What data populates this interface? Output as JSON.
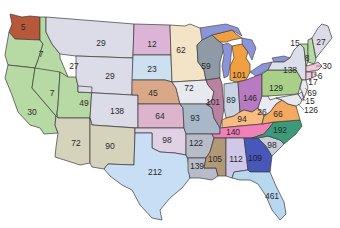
{
  "map": {
    "title": "",
    "states": [
      {
        "abbr": "WA",
        "value": "5",
        "color": "#b8583a",
        "x": 23,
        "y": 27
      },
      {
        "abbr": "OR",
        "value": "7",
        "color": "#b7d9a3",
        "x": 41,
        "y": 54
      },
      {
        "abbr": "ID",
        "value": "27",
        "color": "#b7d9a3",
        "x": 74,
        "y": 66
      },
      {
        "abbr": "CA",
        "value": "30",
        "color": "#b7d9a3",
        "x": 32,
        "y": 112
      },
      {
        "abbr": "NV",
        "value": "7",
        "color": "#b7d9a3",
        "x": 52,
        "y": 93
      },
      {
        "abbr": "UT",
        "value": "49",
        "color": "#b7d9a3",
        "x": 84,
        "y": 103
      },
      {
        "abbr": "AZ",
        "value": "72",
        "color": "#d6d3bd",
        "x": 76,
        "y": 143
      },
      {
        "abbr": "MT",
        "value": "29",
        "color": "#dcdbe8",
        "x": 101,
        "y": 43
      },
      {
        "abbr": "WY",
        "value": "29",
        "color": "#dcdbe8",
        "x": 110,
        "y": 76
      },
      {
        "abbr": "CO",
        "value": "138",
        "color": "#dcdbe8",
        "x": 117,
        "y": 111
      },
      {
        "abbr": "NM",
        "value": "90",
        "color": "#d6d3bd",
        "x": 110,
        "y": 146
      },
      {
        "abbr": "ND",
        "value": "12",
        "color": "#dcb4d6",
        "x": 152,
        "y": 44
      },
      {
        "abbr": "SD",
        "value": "23",
        "color": "#cce0f0",
        "x": 152,
        "y": 69
      },
      {
        "abbr": "NE",
        "value": "45",
        "color": "#d8a888",
        "x": 153,
        "y": 93
      },
      {
        "abbr": "KS",
        "value": "64",
        "color": "#dcb4cc",
        "x": 160,
        "y": 116
      },
      {
        "abbr": "OK",
        "value": "98",
        "color": "#e0d2e4",
        "x": 167,
        "y": 140
      },
      {
        "abbr": "TX",
        "value": "212",
        "color": "#c8def4",
        "x": 155,
        "y": 172
      },
      {
        "abbr": "MN",
        "value": "62",
        "color": "#f3e4c8",
        "x": 181,
        "y": 50
      },
      {
        "abbr": "IA",
        "value": "72",
        "color": "#e8e8ef",
        "x": 189,
        "y": 88
      },
      {
        "abbr": "MO",
        "value": "93",
        "color": "#a8b8c8",
        "x": 195,
        "y": 118
      },
      {
        "abbr": "AR",
        "value": "122",
        "color": "#b8bcc8",
        "x": 196,
        "y": 143
      },
      {
        "abbr": "LA",
        "value": "139",
        "color": "#b8bcc8",
        "x": 197,
        "y": 166
      },
      {
        "abbr": "WI",
        "value": "59",
        "color": "#8f9aa6",
        "x": 206,
        "y": 66
      },
      {
        "abbr": "IL",
        "value": "101",
        "color": "#b882a0",
        "x": 213,
        "y": 102
      },
      {
        "abbr": "MI",
        "value": "101",
        "color": "#f0a040",
        "x": 239,
        "y": 75
      },
      {
        "abbr": "IN",
        "value": "89",
        "color": "#c8d4e4",
        "x": 231,
        "y": 100
      },
      {
        "abbr": "OH",
        "value": "146",
        "color": "#b87ac0",
        "x": 250,
        "y": 98
      },
      {
        "abbr": "KY",
        "value": "94",
        "color": "#f8bc80",
        "x": 242,
        "y": 119
      },
      {
        "abbr": "TN",
        "value": "140",
        "color": "#f080b8",
        "x": 233,
        "y": 132
      },
      {
        "abbr": "MS",
        "value": "105",
        "color": "#b09878",
        "x": 215,
        "y": 159
      },
      {
        "abbr": "AL",
        "value": "112",
        "color": "#d0c8e8",
        "x": 236,
        "y": 159
      },
      {
        "abbr": "GA",
        "value": "109",
        "color": "#4858b8",
        "x": 255,
        "y": 158
      },
      {
        "abbr": "FL",
        "value": "461",
        "color": "#b8d8f0",
        "x": 272,
        "y": 196
      },
      {
        "abbr": "SC",
        "value": "98",
        "color": "#c8ccd8",
        "x": 272,
        "y": 145
      },
      {
        "abbr": "NC",
        "value": "192",
        "color": "#3a9a7a",
        "x": 280,
        "y": 130
      },
      {
        "abbr": "VA",
        "value": "66",
        "color": "#f4a860",
        "x": 278,
        "y": 114
      },
      {
        "abbr": "WV",
        "value": "26",
        "color": "#e8eaf0",
        "x": 262,
        "y": 112
      },
      {
        "abbr": "PA",
        "value": "129",
        "color": "#a8d088",
        "x": 276,
        "y": 88
      },
      {
        "abbr": "NY",
        "value": "138",
        "color": "#dcdfea",
        "x": 290,
        "y": 70
      },
      {
        "abbr": "VT",
        "value": "15",
        "color": "#b7d9a3",
        "x": 295,
        "y": 43
      },
      {
        "abbr": "NH",
        "value": "8",
        "color": "#b7d9a3",
        "x": 307,
        "y": 58
      },
      {
        "abbr": "ME",
        "value": "27",
        "color": "#dcdbe8",
        "x": 321,
        "y": 42
      },
      {
        "abbr": "MA",
        "value": "30",
        "color": "#f0c8d8",
        "x": 327,
        "y": 66
      },
      {
        "abbr": "RI",
        "value": "6",
        "color": "#f0c8d8",
        "x": 320,
        "y": 76
      },
      {
        "abbr": "CT",
        "value": "17",
        "color": "#f0c8d8",
        "x": 313,
        "y": 82
      },
      {
        "abbr": "NJ",
        "value": "69",
        "color": "#e8e8ef",
        "x": 312,
        "y": 93
      },
      {
        "abbr": "DE",
        "value": "15",
        "color": "#e8e8ef",
        "x": 310,
        "y": 101
      },
      {
        "abbr": "MD",
        "value": "126",
        "color": "#e8e8ef",
        "x": 311,
        "y": 110
      }
    ],
    "lake_color": "#8a94d6",
    "border_color": "#3a3a3a"
  }
}
